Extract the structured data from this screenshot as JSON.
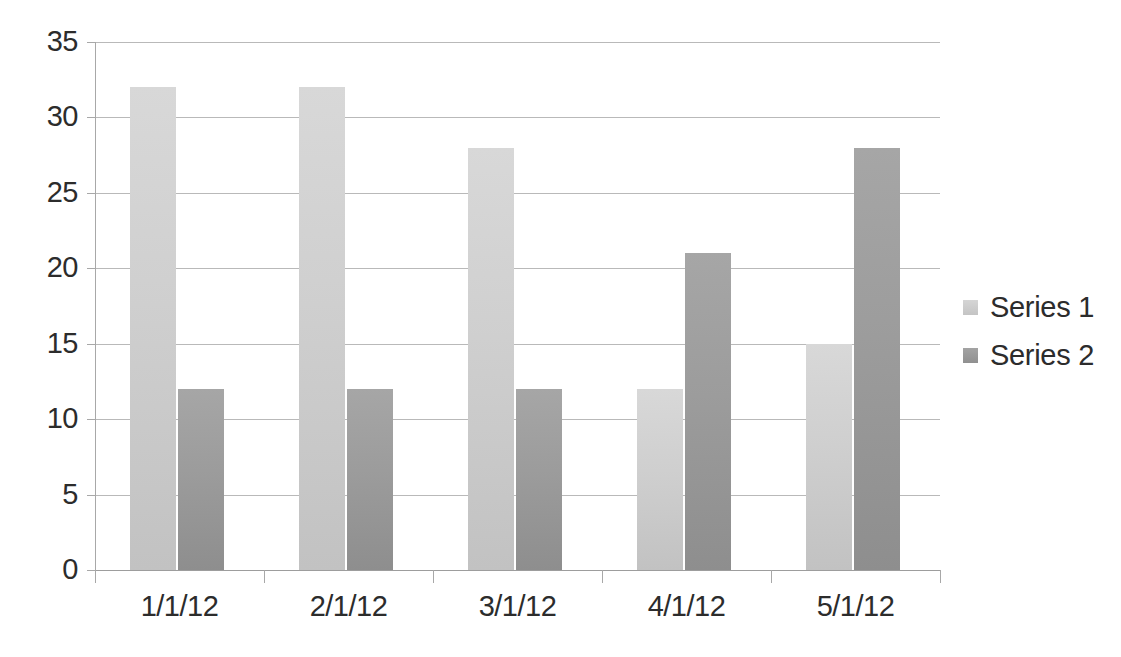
{
  "chart_data": {
    "type": "bar",
    "title": "",
    "subtitle": "",
    "xlabel": "",
    "ylabel": "",
    "categories": [
      "1/1/12",
      "2/1/12",
      "3/1/12",
      "4/1/12",
      "5/1/12"
    ],
    "series": [
      {
        "name": "Series 1",
        "values": [
          32,
          32,
          28,
          12,
          15
        ],
        "color": "#cdcdcd"
      },
      {
        "name": "Series 2",
        "values": [
          12,
          12,
          12,
          21,
          28
        ],
        "color": "#9a9a9a"
      }
    ],
    "ylim": [
      0,
      35
    ],
    "ytick_labels": [
      "0",
      "5",
      "10",
      "15",
      "20",
      "25",
      "30",
      "35"
    ],
    "ytick_values": [
      0,
      5,
      10,
      15,
      20,
      25,
      30,
      35
    ],
    "grid": "horizontal",
    "legend_position": "right",
    "legend_entries": [
      "Series 1",
      "Series 2"
    ],
    "bar_grouping": "clustered"
  },
  "colors": {
    "background": "#ffffff",
    "gridline": "#b9b9b9",
    "axis": "#a8a8a8",
    "text": "#2c2c2c",
    "series_1": "#cdcdcd",
    "series_2": "#9a9a9a"
  }
}
